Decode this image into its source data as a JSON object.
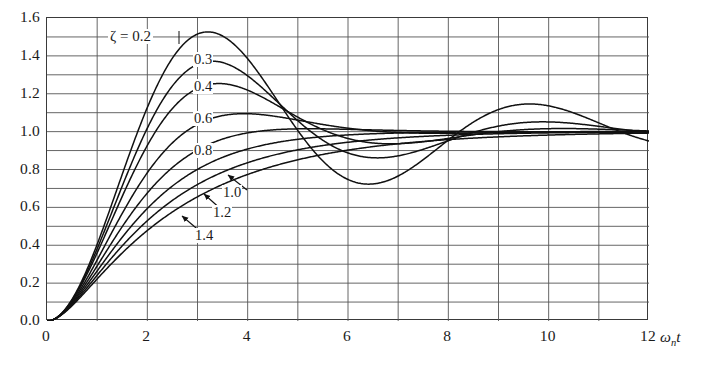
{
  "figure": {
    "kind": "line-chart",
    "background": "#ffffff",
    "line_color": "#111111",
    "grid_color": "#555555",
    "axis_color": "#3a3a3a"
  },
  "axes": {
    "x_title": "ω",
    "x_title_sub": "n",
    "x_title_tail": "t",
    "x_ticks": [
      "0",
      "2",
      "4",
      "6",
      "8",
      "10",
      "12"
    ],
    "x_tick_values": [
      0,
      2,
      4,
      6,
      8,
      10,
      12
    ],
    "y_ticks": [
      "0.0",
      "0.2",
      "0.4",
      "0.6",
      "0.8",
      "1.0",
      "1.2",
      "1.4",
      "1.6"
    ],
    "y_tick_values": [
      0.0,
      0.2,
      0.4,
      0.6,
      0.8,
      1.0,
      1.2,
      1.4,
      1.6
    ],
    "x_minor_step": 1,
    "y_minor_step": 0.1
  },
  "annotations": {
    "zeta_title": "ζ = 0.2",
    "labels": [
      {
        "text": "0.3",
        "x": 193,
        "y": 52
      },
      {
        "text": "0.4",
        "x": 193,
        "y": 79
      },
      {
        "text": "0.6",
        "x": 193,
        "y": 111
      },
      {
        "text": "0.8",
        "x": 193,
        "y": 143
      },
      {
        "text": "1.0",
        "x": 222,
        "y": 185
      },
      {
        "text": "1.2",
        "x": 212,
        "y": 205
      },
      {
        "text": "1.4",
        "x": 194,
        "y": 228
      }
    ]
  },
  "chart_data": {
    "type": "line",
    "title": "",
    "subtitle": "",
    "xlabel": "ωn t",
    "ylabel": "",
    "xlim": [
      0,
      12
    ],
    "ylim": [
      0,
      1.6
    ],
    "grid": true,
    "legend_position": "inline-curve-labels",
    "x": [
      0,
      0.25,
      0.5,
      0.75,
      1,
      1.25,
      1.5,
      1.75,
      2,
      2.25,
      2.5,
      2.75,
      3,
      3.25,
      3.5,
      3.75,
      4,
      4.5,
      5,
      5.5,
      6,
      6.5,
      7,
      7.5,
      8,
      8.5,
      9,
      9.5,
      10,
      10.5,
      11,
      11.5,
      12
    ],
    "series": [
      {
        "name": "0.2",
        "zeta": 0.2,
        "peak_value": 1.527,
        "peak_time": 3.21,
        "trough_value": 0.727,
        "trough_time": 6.41,
        "second_peak_value": 1.139,
        "second_peak_time": 9.62,
        "values": [
          0,
          0.03,
          0.114,
          0.242,
          0.4,
          0.574,
          0.75,
          0.914,
          1.057,
          1.171,
          1.253,
          1.301,
          1.318,
          1.306,
          1.27,
          1.215,
          1.148,
          1.0,
          0.864,
          0.769,
          0.725,
          0.735,
          0.792,
          0.879,
          0.977,
          1.067,
          1.133,
          1.165,
          1.161,
          1.125,
          1.068,
          1.003,
          0.944
        ]
      },
      {
        "name": "0.3",
        "zeta": 0.3,
        "peak_value": 1.372,
        "peak_time": 3.29,
        "trough_value": 0.847,
        "trough_time": 6.59,
        "values": [
          0,
          0.029,
          0.11,
          0.231,
          0.379,
          0.536,
          0.691,
          0.831,
          0.947,
          1.035,
          1.092,
          1.118,
          1.117,
          1.093,
          1.052,
          1.0,
          0.943,
          0.834,
          0.76,
          0.731,
          0.744,
          0.788,
          0.85,
          0.916,
          0.975,
          1.018,
          1.042,
          1.046,
          1.034,
          1.01,
          0.982,
          0.954,
          0.932
        ]
      },
      {
        "name": "0.4",
        "zeta": 0.4,
        "peak_value": 1.254,
        "peak_time": 3.43,
        "trough_value": 0.917,
        "trough_time": 6.86,
        "values": [
          0,
          0.029,
          0.107,
          0.221,
          0.358,
          0.5,
          0.636,
          0.755,
          0.85,
          0.919,
          0.96,
          0.976,
          0.971,
          0.95,
          0.919,
          0.883,
          0.847,
          0.788,
          0.762,
          0.764,
          0.784,
          0.813,
          0.844,
          0.872,
          0.893,
          0.906,
          0.911,
          0.91,
          0.905,
          0.898,
          0.891,
          0.886,
          0.883
        ]
      },
      {
        "name": "0.6",
        "zeta": 0.6,
        "peak_value": 1.095,
        "peak_time": 3.93,
        "trough_value": 0.982,
        "trough_time": 7.85,
        "values": [
          0,
          0.027,
          0.098,
          0.197,
          0.311,
          0.425,
          0.53,
          0.62,
          0.691,
          0.744,
          0.779,
          0.799,
          0.807,
          0.807,
          0.801,
          0.793,
          0.784,
          0.769,
          0.763,
          0.765,
          0.772,
          0.78,
          0.787,
          0.792,
          0.795,
          0.796,
          0.796,
          0.795,
          0.794,
          0.793,
          0.793,
          0.793,
          0.793
        ]
      },
      {
        "name": "0.8",
        "zeta": 0.8,
        "peak_value": 1.015,
        "peak_time": 5.24,
        "values": [
          0,
          0.025,
          0.087,
          0.171,
          0.264,
          0.356,
          0.441,
          0.517,
          0.581,
          0.633,
          0.675,
          0.708,
          0.733,
          0.752,
          0.766,
          0.776,
          0.783,
          0.792,
          0.795,
          0.796,
          0.795,
          0.794,
          0.794,
          0.793,
          0.793,
          0.793,
          0.793,
          0.793,
          0.793,
          0.793,
          0.793,
          0.793,
          0.793
        ]
      },
      {
        "name": "1.0",
        "zeta": 1.0,
        "peak_value": 1.0,
        "values": [
          0,
          0.023,
          0.078,
          0.151,
          0.23,
          0.308,
          0.38,
          0.445,
          0.502,
          0.551,
          0.593,
          0.629,
          0.659,
          0.685,
          0.706,
          0.724,
          0.739,
          0.762,
          0.778,
          0.789,
          0.796,
          0.802,
          0.806,
          0.809,
          0.811,
          0.812,
          0.813,
          0.814,
          0.814,
          0.814,
          0.815,
          0.815,
          0.815
        ]
      },
      {
        "name": "1.2",
        "zeta": 1.2,
        "peak_value": 1.0,
        "values": [
          0,
          0.021,
          0.071,
          0.136,
          0.206,
          0.275,
          0.34,
          0.399,
          0.452,
          0.499,
          0.541,
          0.577,
          0.609,
          0.637,
          0.661,
          0.682,
          0.7,
          0.73,
          0.753,
          0.77,
          0.783,
          0.793,
          0.8,
          0.806,
          0.81,
          0.813,
          0.816,
          0.817,
          0.819,
          0.82,
          0.82,
          0.821,
          0.821
        ]
      },
      {
        "name": "1.4",
        "zeta": 1.4,
        "peak_value": 1.0,
        "values": [
          0,
          0.019,
          0.064,
          0.124,
          0.188,
          0.25,
          0.309,
          0.364,
          0.414,
          0.459,
          0.5,
          0.536,
          0.568,
          0.597,
          0.623,
          0.646,
          0.666,
          0.7,
          0.727,
          0.749,
          0.766,
          0.78,
          0.791,
          0.8,
          0.807,
          0.812,
          0.817,
          0.82,
          0.823,
          0.826,
          0.828,
          0.829,
          0.83
        ]
      }
    ]
  }
}
